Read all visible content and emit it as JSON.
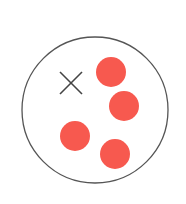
{
  "diagram": {
    "container": {
      "cx": 95,
      "cy": 110,
      "r": 73,
      "stroke": "#555555"
    },
    "marker": {
      "type": "x",
      "cx": 71,
      "cy": 83,
      "half": 11,
      "color": "#444444"
    },
    "dots": [
      {
        "cx": 111,
        "cy": 72,
        "r": 15
      },
      {
        "cx": 124,
        "cy": 106,
        "r": 15
      },
      {
        "cx": 75,
        "cy": 136,
        "r": 15
      },
      {
        "cx": 115,
        "cy": 154,
        "r": 15
      }
    ],
    "dot_color": "#f7594f"
  }
}
